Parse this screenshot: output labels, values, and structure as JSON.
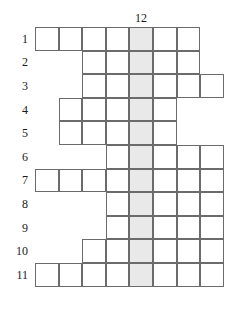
{
  "puzzle": {
    "type": "crossword-skeleton-grid",
    "column_count": 8,
    "row_count": 11,
    "highlight_column_index": 5,
    "highlight_column_label": "12",
    "cell_size": 23.6,
    "grid_origin_x": 35,
    "grid_origin_y": 27,
    "colors": {
      "cell_fill": "#ffffff",
      "cell_border": "#6b6b6b",
      "highlight_fill": "#e9e9e9",
      "text": "#1a1a1a",
      "background": "#ffffff"
    },
    "column_label": {
      "text": "12",
      "x": 141,
      "y": 12
    },
    "rows": [
      {
        "label": "1",
        "start_col": 1,
        "end_col": 7,
        "length": 7
      },
      {
        "label": "2",
        "start_col": 3,
        "end_col": 7,
        "length": 5
      },
      {
        "label": "3",
        "start_col": 3,
        "end_col": 8,
        "length": 6
      },
      {
        "label": "4",
        "start_col": 2,
        "end_col": 6,
        "length": 5
      },
      {
        "label": "5",
        "start_col": 2,
        "end_col": 6,
        "length": 5
      },
      {
        "label": "6",
        "start_col": 4,
        "end_col": 8,
        "length": 5
      },
      {
        "label": "7",
        "start_col": 1,
        "end_col": 8,
        "length": 8
      },
      {
        "label": "8",
        "start_col": 4,
        "end_col": 8,
        "length": 5
      },
      {
        "label": "9",
        "start_col": 4,
        "end_col": 8,
        "length": 5
      },
      {
        "label": "10",
        "start_col": 3,
        "end_col": 8,
        "length": 6
      },
      {
        "label": "11",
        "start_col": 1,
        "end_col": 8,
        "length": 8
      }
    ]
  }
}
